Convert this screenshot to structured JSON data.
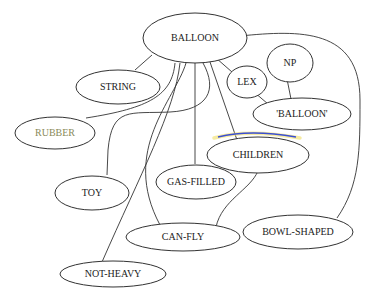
{
  "diagram": {
    "type": "concept-graph",
    "nodes": [
      {
        "id": "balloon",
        "label": "BALLOON"
      },
      {
        "id": "string",
        "label": "STRING"
      },
      {
        "id": "rubber",
        "label": "RUBBER",
        "label_color": "#8a8a5a"
      },
      {
        "id": "lex",
        "label": "LEX"
      },
      {
        "id": "np",
        "label": "NP"
      },
      {
        "id": "balloon_quoted",
        "label": "'BALLOON'"
      },
      {
        "id": "children",
        "label": "CHILDREN",
        "highlight_arc_color": "#3b4fd1"
      },
      {
        "id": "toy",
        "label": "TOY"
      },
      {
        "id": "gas_filled",
        "label": "GAS-FILLED"
      },
      {
        "id": "can_fly",
        "label": "CAN-FLY"
      },
      {
        "id": "bowl_shaped",
        "label": "BOWL-SHAPED"
      },
      {
        "id": "not_heavy",
        "label": "NOT-HEAVY"
      }
    ],
    "edges": [
      {
        "from": "balloon",
        "to": "string"
      },
      {
        "from": "balloon",
        "to": "rubber"
      },
      {
        "from": "balloon",
        "to": "toy"
      },
      {
        "from": "balloon",
        "to": "not_heavy"
      },
      {
        "from": "balloon",
        "to": "can_fly"
      },
      {
        "from": "balloon",
        "to": "gas_filled"
      },
      {
        "from": "balloon",
        "to": "children"
      },
      {
        "from": "balloon",
        "to": "lex"
      },
      {
        "from": "balloon",
        "to": "bowl_shaped"
      },
      {
        "from": "balloon",
        "to": "children_via_curve"
      },
      {
        "from": "lex",
        "to": "balloon_quoted"
      },
      {
        "from": "np",
        "to": "balloon_quoted"
      },
      {
        "from": "children",
        "to": "can_fly"
      }
    ]
  }
}
